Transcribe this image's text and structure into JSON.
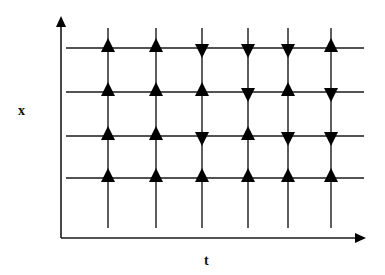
{
  "diagram": {
    "type": "direction-field-grid",
    "axes": {
      "x_label": "x",
      "t_label": "t"
    },
    "colors": {
      "line": "#1a1a1a",
      "arrow": "#000000",
      "background": "#ffffff"
    },
    "geometry": {
      "y_axis": {
        "x": 61,
        "y_top": 16,
        "y_bottom": 238
      },
      "t_axis": {
        "y": 238,
        "x_left": 61,
        "x_right": 366
      },
      "h_line_x_start": 66,
      "h_line_x_end": 364,
      "v_line_y_top": 28,
      "v_line_y_bottom": 228,
      "columns_x": [
        108,
        156,
        202,
        248,
        288,
        331
      ],
      "rows_y": [
        48,
        92,
        136,
        178
      ]
    },
    "arrows": [
      [
        "up",
        "up",
        "down",
        "down",
        "down",
        "up"
      ],
      [
        "up",
        "up",
        "up",
        "down",
        "up",
        "down"
      ],
      [
        "up",
        "up",
        "down",
        "up",
        "down",
        "down"
      ],
      [
        "up",
        "up",
        "up",
        "up",
        "up",
        "up"
      ]
    ]
  }
}
